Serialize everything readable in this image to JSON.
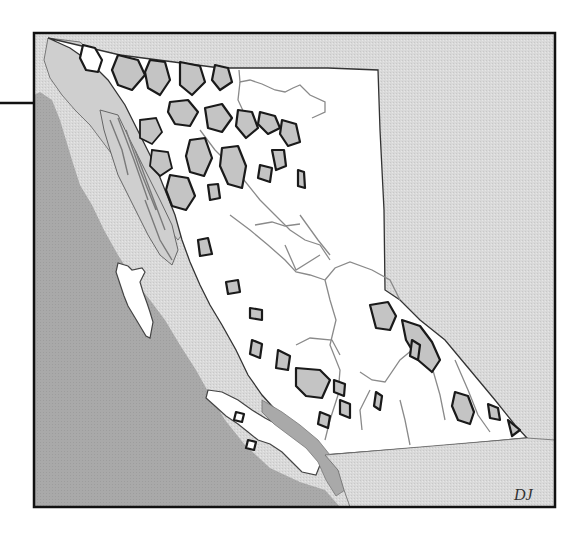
{
  "figure": {
    "signature": "DJ",
    "colors": {
      "background": "#ffffff",
      "ocean": "#a9a9a9",
      "neighbor_land": "#d9d9d9",
      "province_land": "#ffffff",
      "ice_field": "#c4c4c4",
      "coastal_land": "#cfcfcf",
      "outline": "#1a1a1a",
      "river": "#8a8a8a",
      "frame": "#111111"
    },
    "frame": {
      "x": 34,
      "y": 33,
      "width": 521,
      "height": 474
    },
    "leader_line": {
      "x1": 0,
      "y1": 103,
      "x2": 34,
      "y2": 103
    }
  }
}
